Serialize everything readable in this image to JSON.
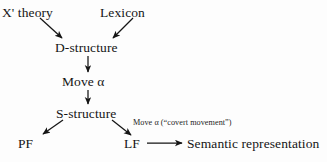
{
  "diagram": {
    "background_color": "#fdfdfd",
    "ink_color": "#151515",
    "nodes": {
      "x_bar_theory": "X' theory",
      "lexicon": "Lexicon",
      "d_structure": "D-structure",
      "move_alpha": "Move α",
      "s_structure": "S-structure",
      "pf": "PF",
      "lf": "LF",
      "semantic_representation": "Semantic representation"
    },
    "annotations": {
      "covert_movement": "Move α (“covert movement”)"
    },
    "edges": [
      {
        "id": "xbar-to-dstructure",
        "from": "X' theory",
        "to": "D-structure",
        "style": "diagonal-arrow"
      },
      {
        "id": "lexicon-to-dstructure",
        "from": "Lexicon",
        "to": "D-structure",
        "style": "diagonal-arrow"
      },
      {
        "id": "dstructure-to-movealpha",
        "from": "D-structure",
        "to": "Move α",
        "style": "vertical-arrow"
      },
      {
        "id": "movealpha-to-sstructure",
        "from": "Move α",
        "to": "S-structure",
        "style": "vertical-arrow"
      },
      {
        "id": "sstructure-to-pf",
        "from": "S-structure",
        "to": "PF",
        "style": "diagonal-arrow"
      },
      {
        "id": "sstructure-to-lf",
        "from": "S-structure",
        "to": "LF",
        "style": "diagonal-arrow",
        "label": "Move α (“covert movement”)"
      },
      {
        "id": "lf-to-semantic",
        "from": "LF",
        "to": "Semantic representation",
        "style": "horizontal-arrow"
      }
    ]
  }
}
